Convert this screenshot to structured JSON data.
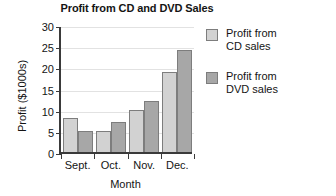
{
  "chart_data": {
    "type": "bar",
    "title": "Profit from CD and DVD Sales",
    "xlabel": "Month",
    "ylabel": "Profit ($1000s)",
    "categories": [
      "Sept.",
      "Oct.",
      "Nov.",
      "Dec."
    ],
    "series": [
      {
        "name": "Profit from CD sales",
        "values": [
          8,
          5,
          10,
          19
        ],
        "color": "#d2d2d2"
      },
      {
        "name": "Profit from DVD sales",
        "values": [
          5,
          7,
          12,
          24
        ],
        "color": "#a7a7a7"
      }
    ],
    "ylim": [
      0,
      30
    ],
    "ytick_step": 5,
    "ytick_labels": [
      "0",
      "5",
      "10",
      "15",
      "20",
      "25",
      "30"
    ],
    "grid": true,
    "legend_position": "right"
  },
  "legend": {
    "entries": [
      {
        "line1": "Profit from",
        "line2": "CD sales"
      },
      {
        "line1": "Profit from",
        "line2": "DVD sales"
      }
    ]
  }
}
